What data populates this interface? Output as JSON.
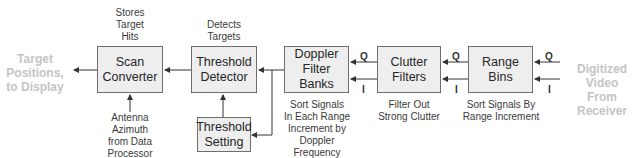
{
  "diagram": {
    "blocks": {
      "scan_converter": "Scan\nConverter",
      "threshold_detector": "Threshold\nDetector",
      "threshold_setting": "Threshold\nSetting",
      "doppler_filter_banks": "Doppler\nFilter\nBanks",
      "clutter_filters": "Clutter\nFilters",
      "range_bins": "Range\nBins"
    },
    "annotations": {
      "scan_converter_top": "Stores\nTarget\nHits",
      "scan_converter_bottom": "Antenna\nAzimuth\nfrom Data\nProcessor",
      "threshold_detector_top": "Detects\nTargets",
      "doppler_bottom": "Sort Signals\nIn Each Range\nIncrement by\nDoppler\nFrequency",
      "clutter_bottom": "Filter Out\nStrong Clutter",
      "range_bins_bottom": "Sort Signals By\nRange Increment"
    },
    "external": {
      "output": "Target\nPositions,\nto Display",
      "input": "Digitized Video\nFrom Receiver"
    },
    "channel_labels": {
      "q": "Q",
      "i": "I"
    },
    "colors": {
      "box_fill": "#eeeeee",
      "box_border": "#6e6e6e",
      "external_text": "#c4c4c4",
      "line": "#333333"
    }
  }
}
